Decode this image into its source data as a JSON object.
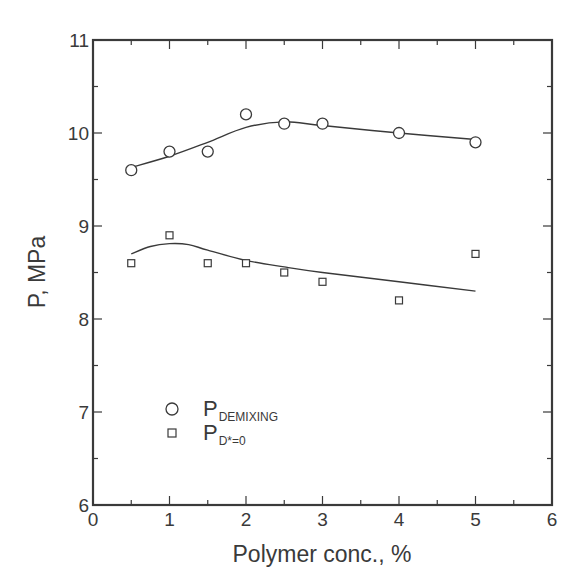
{
  "chart_data": {
    "type": "scatter",
    "title": "",
    "xlabel": "Polymer conc., %",
    "ylabel": "P, MPa",
    "xlim": [
      0,
      6
    ],
    "ylim": [
      6,
      11
    ],
    "x_ticks": [
      0,
      1,
      2,
      3,
      4,
      5,
      6
    ],
    "y_ticks": [
      6,
      7,
      8,
      9,
      10,
      11
    ],
    "x_minor_step": 0.5,
    "y_minor_step": 0.5,
    "grid": false,
    "legend_position": "lower-left inside",
    "series": [
      {
        "name": "P_DEMIXING",
        "label_main": "P",
        "label_sub": "DEMIXING",
        "marker": "circle",
        "x": [
          0.5,
          1.0,
          1.5,
          2.0,
          2.5,
          3.0,
          4.0,
          5.0
        ],
        "y": [
          9.6,
          9.8,
          9.8,
          10.2,
          10.1,
          10.1,
          10.0,
          9.9
        ],
        "fit_line": {
          "x": [
            0.5,
            1.0,
            1.5,
            2.0,
            2.5,
            3.0,
            4.0,
            5.0
          ],
          "y": [
            9.63,
            9.75,
            9.9,
            10.06,
            10.12,
            10.08,
            10.0,
            9.93
          ]
        }
      },
      {
        "name": "P_D*=0",
        "label_main": "P",
        "label_sub": "D*=0",
        "marker": "square",
        "x": [
          0.5,
          1.0,
          1.5,
          2.0,
          2.5,
          3.0,
          4.0,
          5.0
        ],
        "y": [
          8.6,
          8.9,
          8.6,
          8.6,
          8.5,
          8.4,
          8.2,
          8.7
        ],
        "fit_line": {
          "x": [
            0.5,
            0.75,
            1.0,
            1.25,
            1.5,
            2.0,
            2.5,
            3.0,
            4.0,
            5.0
          ],
          "y": [
            8.7,
            8.78,
            8.81,
            8.8,
            8.74,
            8.63,
            8.56,
            8.5,
            8.4,
            8.3
          ]
        }
      }
    ]
  },
  "colors": {
    "ink": "#3a3a3a",
    "background": "#ffffff"
  }
}
